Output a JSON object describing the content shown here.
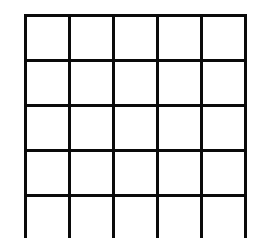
{
  "grid": {
    "columns": 5,
    "visible_rows": 5,
    "line_color": "#0a0a0a",
    "cell_color": "#ffffff",
    "cells": [
      [
        "",
        "",
        "",
        "",
        ""
      ],
      [
        "",
        "",
        "",
        "",
        ""
      ],
      [
        "",
        "",
        "",
        "",
        ""
      ],
      [
        "",
        "",
        "",
        "",
        ""
      ],
      [
        "",
        "",
        "",
        "",
        ""
      ]
    ]
  }
}
